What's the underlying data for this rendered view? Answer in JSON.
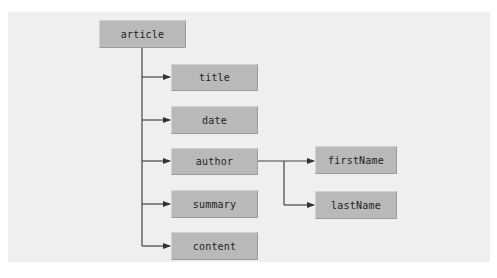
{
  "diagram": {
    "root": {
      "label": "article"
    },
    "children": [
      {
        "label": "title"
      },
      {
        "label": "date"
      },
      {
        "label": "author"
      },
      {
        "label": "summary"
      },
      {
        "label": "content"
      }
    ],
    "author_children": [
      {
        "label": "firstName"
      },
      {
        "label": "lastName"
      }
    ],
    "colors": {
      "background": "#efefef",
      "node_fill": "#b9b9b9",
      "line": "#333333"
    }
  }
}
